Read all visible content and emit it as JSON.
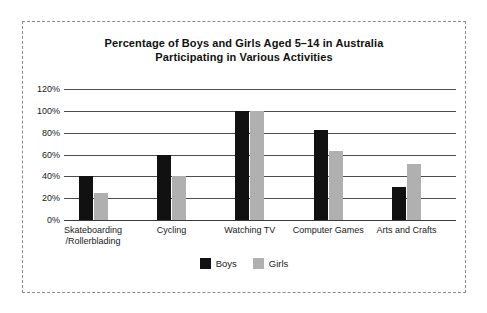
{
  "figure": {
    "border_style": "dashed",
    "border_color": "#8c8c8c",
    "background": "#ffffff"
  },
  "legend": {
    "position": "bottom-center",
    "entries": [
      {
        "label": "Boys",
        "color": "#111111"
      },
      {
        "label": "Girls",
        "color": "#b0b0b0"
      }
    ]
  },
  "chart_data": {
    "type": "bar",
    "title": "Percentage of Boys and Girls Aged 5–14 in Australia Participating in Various Activities",
    "title_line1": "Percentage of Boys and Girls Aged 5–14 in Australia",
    "title_line2": "Participating in Various Activities",
    "xlabel": "",
    "ylabel": "",
    "ylim": [
      0,
      120
    ],
    "grid": true,
    "legend_position": "bottom-center",
    "ytick_labels": [
      "0%",
      "20%",
      "40%",
      "60%",
      "80%",
      "100%",
      "120%"
    ],
    "ytick_values": [
      0,
      20,
      40,
      60,
      80,
      100,
      120
    ],
    "categories": [
      "Skateboarding/Rollerblading",
      "Cycling",
      "Watching TV",
      "Computer Games",
      "Arts and Crafts"
    ],
    "category_lines": [
      [
        "Skateboarding",
        "/Rollerblading"
      ],
      [
        "Cycling",
        ""
      ],
      [
        "Watching TV",
        ""
      ],
      [
        "Computer Games",
        ""
      ],
      [
        "Arts and Crafts",
        ""
      ]
    ],
    "series": [
      {
        "name": "Boys",
        "color": "#111111",
        "values": [
          40,
          60,
          100,
          82,
          30
        ]
      },
      {
        "name": "Girls",
        "color": "#b0b0b0",
        "values": [
          25,
          40,
          100,
          63,
          51
        ]
      }
    ]
  }
}
